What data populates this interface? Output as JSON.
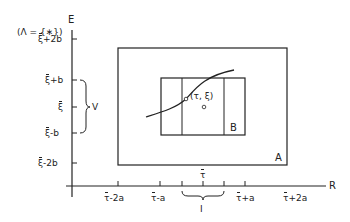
{
  "diagram": {
    "axes": {
      "y_label": "E",
      "x_label": "R",
      "set_note": "(Λ = {∗})"
    },
    "y_ticks": [
      {
        "base": "ξ",
        "suffix": "+2b"
      },
      {
        "base": "ξ",
        "suffix": "+b"
      },
      {
        "base": "ξ",
        "suffix": ""
      },
      {
        "base": "ξ",
        "suffix": "-b"
      },
      {
        "base": "ξ",
        "suffix": "-2b"
      }
    ],
    "x_ticks": [
      {
        "base": "τ",
        "suffix": "-2a"
      },
      {
        "base": "τ",
        "suffix": "-a"
      },
      {
        "base": "τ",
        "suffix": ""
      },
      {
        "base": "τ",
        "suffix": "+a"
      },
      {
        "base": "τ",
        "suffix": "+2a"
      }
    ],
    "brace_labels": {
      "vertical": "V",
      "horizontal": "I"
    },
    "regions": {
      "outer": "A",
      "inner": "B"
    },
    "point_label": "(τ, ξ)",
    "colors": {
      "stroke": "#222222",
      "background": "#ffffff"
    }
  }
}
